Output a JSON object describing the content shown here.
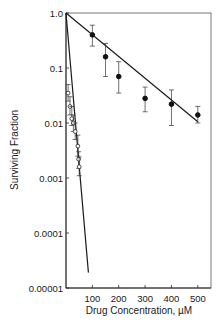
{
  "chart_data": {
    "type": "scatter",
    "title": "",
    "xlabel": "Drug Concentration, µM",
    "ylabel": "Surviving Fraction",
    "xscale": "linear",
    "yscale": "log",
    "xlim": [
      0,
      550
    ],
    "ylim": [
      1e-05,
      1.0
    ],
    "x_ticks": [
      100,
      200,
      300,
      400,
      500
    ],
    "x_tick_labels": [
      "100",
      "200",
      "300",
      "400",
      "500"
    ],
    "y_ticks": [
      1.0,
      0.1,
      0.01,
      0.001,
      0.0001,
      1e-05
    ],
    "y_tick_labels": [
      "1.0",
      "0.1",
      "0.01",
      "0.001",
      "0.0001",
      "0.00001"
    ],
    "grid": false,
    "legend": null,
    "series": [
      {
        "name": "filled circles",
        "marker": "filled-circle",
        "points": [
          {
            "x": 100,
            "y": 0.4,
            "err_low": 0.25,
            "err_high": 0.6
          },
          {
            "x": 150,
            "y": 0.16,
            "err_low": 0.07,
            "err_high": 0.28
          },
          {
            "x": 200,
            "y": 0.07,
            "err_low": 0.035,
            "err_high": 0.13
          },
          {
            "x": 300,
            "y": 0.028,
            "err_low": 0.016,
            "err_high": 0.045
          },
          {
            "x": 400,
            "y": 0.022,
            "err_low": 0.009,
            "err_high": 0.04
          },
          {
            "x": 500,
            "y": 0.014,
            "err_low": 0.01,
            "err_high": 0.02
          }
        ],
        "fit_line": {
          "x": [
            0,
            500
          ],
          "y": [
            1.0,
            0.0105
          ]
        }
      },
      {
        "name": "open circles",
        "marker": "open-circle",
        "points": [
          {
            "x": 8,
            "y": 0.035,
            "err_low": 0.025,
            "err_high": 0.05
          },
          {
            "x": 15,
            "y": 0.02,
            "err_low": 0.014,
            "err_high": 0.03
          },
          {
            "x": 22,
            "y": 0.012,
            "err_low": 0.009,
            "err_high": 0.02
          },
          {
            "x": 28,
            "y": 0.01,
            "err_low": 0.007,
            "err_high": 0.014
          },
          {
            "x": 35,
            "y": 0.007,
            "err_low": 0.005,
            "err_high": 0.01
          },
          {
            "x": 45,
            "y": 0.0038,
            "err_low": 0.0025,
            "err_high": 0.006
          },
          {
            "x": 48,
            "y": 0.0022,
            "err_low": 0.0015,
            "err_high": 0.003
          },
          {
            "x": 50,
            "y": 0.0016,
            "err_low": 0.0011,
            "err_high": 0.0024
          }
        ],
        "fit_line": {
          "x": [
            0,
            85
          ],
          "y": [
            1.0,
            1.9e-05
          ]
        }
      }
    ]
  }
}
